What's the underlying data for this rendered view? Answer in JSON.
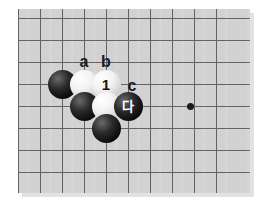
{
  "diagram": {
    "type": "go-board-problem",
    "board": {
      "background_color": "#d2d2d2",
      "line_color": "#636363",
      "columns": 10,
      "rows": 8,
      "cell_size": 22
    },
    "grid": {
      "vertical_x": [
        18,
        40,
        62,
        84,
        106,
        128,
        150,
        172,
        194,
        216
      ],
      "horizontal_y": [
        18,
        40,
        62,
        84,
        106,
        128,
        150,
        172
      ]
    },
    "hoshi": [
      {
        "name": "star-point-right",
        "x": 190,
        "y": 106
      }
    ],
    "stones": [
      {
        "name": "black-stone-left",
        "color": "black",
        "x": 62,
        "y": 84,
        "label": ""
      },
      {
        "name": "white-stone-a-position",
        "color": "white",
        "x": 84,
        "y": 84,
        "label": ""
      },
      {
        "name": "white-stone-move-1",
        "color": "white",
        "x": 106,
        "y": 84,
        "label": "1"
      },
      {
        "name": "black-stone-lower-left",
        "color": "black",
        "x": 84,
        "y": 106,
        "label": ""
      },
      {
        "name": "white-stone-lower",
        "color": "white",
        "x": 106,
        "y": 106,
        "label": ""
      },
      {
        "name": "black-stone-marked",
        "color": "black",
        "x": 128,
        "y": 106,
        "label": "다"
      },
      {
        "name": "black-stone-bottom",
        "color": "black",
        "x": 106,
        "y": 128,
        "label": ""
      }
    ],
    "point_labels": [
      {
        "name": "point-label-a",
        "text": "a",
        "x": 84,
        "y": 62
      },
      {
        "name": "point-label-b",
        "text": "b",
        "x": 106,
        "y": 62
      },
      {
        "name": "point-label-c",
        "text": "c",
        "x": 132,
        "y": 86
      }
    ]
  }
}
